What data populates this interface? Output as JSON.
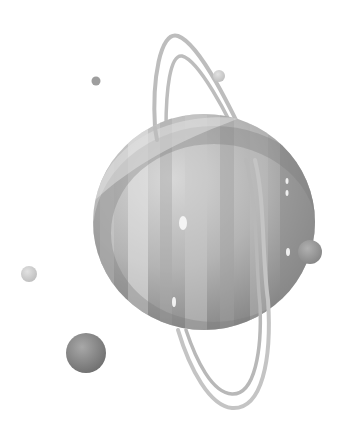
{
  "image": {
    "description": "Grayscale watercolor illustration of a gas giant planet with tilted rings and several small moons",
    "width": 351,
    "height": 446,
    "background": "#ffffff"
  },
  "planet": {
    "cx": 204,
    "cy": 222,
    "rx": 111,
    "ry": 108,
    "colors": {
      "light": "#d4d4d4",
      "mid": "#b0b0b0",
      "dark": "#8a8a8a",
      "shadow": "#6e6e6e"
    }
  },
  "ring": {
    "color": "#b8b8b8",
    "stroke_width": 4
  },
  "moons": [
    {
      "name": "moon-bottom-left",
      "cx": 86,
      "cy": 353,
      "r": 20,
      "color": "#8c8c8c"
    },
    {
      "name": "moon-right",
      "cx": 310,
      "cy": 252,
      "r": 12,
      "color": "#9a9a9a"
    },
    {
      "name": "moon-left",
      "cx": 29,
      "cy": 274,
      "r": 8,
      "color": "#c4c4c4"
    },
    {
      "name": "moon-top",
      "cx": 219,
      "cy": 76,
      "r": 6,
      "color": "#cfcfcf"
    },
    {
      "name": "moon-small-top-left",
      "cx": 96,
      "cy": 81,
      "r": 4.5,
      "color": "#9e9e9e"
    }
  ]
}
